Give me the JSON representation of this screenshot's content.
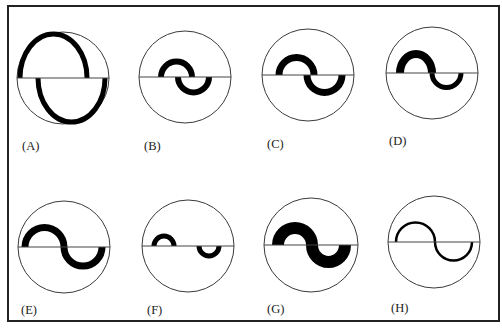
{
  "figure": {
    "background": "#ffffff",
    "frame_color": "#222222",
    "ink_color": "#000000",
    "panels": [
      {
        "id": "A",
        "label": "(A)",
        "cx": 63,
        "cy": 78,
        "r": 46,
        "label_x": 22,
        "label_y": 150,
        "upper": {
          "x1": 20,
          "x2": 87,
          "ry": 44,
          "w": 5
        },
        "lower": {
          "x1": 38,
          "x2": 105,
          "ry": 44,
          "w": 5
        },
        "description": "large S-shaped curve hugging the circle, medium stroke"
      },
      {
        "id": "B",
        "label": "(B)",
        "cx": 185,
        "cy": 77,
        "r": 46,
        "label_x": 144,
        "label_y": 150,
        "upper": {
          "x1": 161,
          "x2": 192,
          "ry": 15.5,
          "w": 6
        },
        "lower": {
          "x1": 178,
          "x2": 209,
          "ry": 15.5,
          "w": 6
        },
        "description": "small S-curve centered, medium-thick stroke"
      },
      {
        "id": "C",
        "label": "(C)",
        "cx": 308,
        "cy": 75,
        "r": 46,
        "label_x": 267,
        "label_y": 148,
        "upper": {
          "x1": 279,
          "x2": 314,
          "ry": 17.5,
          "w": 7
        },
        "lower": {
          "x1": 307,
          "x2": 342,
          "ry": 17.5,
          "w": 7
        },
        "description": "medium S-curve, thick stroke"
      },
      {
        "id": "D",
        "label": "(D)",
        "cx": 432,
        "cy": 73,
        "r": 46,
        "label_x": 389,
        "label_y": 145,
        "upper": {
          "x1": 400,
          "x2": 432,
          "ry": 19,
          "w": 8
        },
        "lower": {
          "x1": 432,
          "x2": 461,
          "ry": 14.5,
          "w": 5
        },
        "description": "S-curve with taller thicker upper arc and thinner lower arc"
      },
      {
        "id": "E",
        "label": "(E)",
        "cx": 64,
        "cy": 247,
        "r": 46,
        "label_x": 21,
        "label_y": 314,
        "upper": {
          "x1": 25,
          "x2": 64,
          "ry": 19.5,
          "w": 7
        },
        "lower": {
          "x1": 64,
          "x2": 102,
          "ry": 19,
          "w": 7
        },
        "description": "wide S-curve spanning most of diameter, thick stroke"
      },
      {
        "id": "F",
        "label": "(F)",
        "cx": 188,
        "cy": 246,
        "r": 46,
        "label_x": 147,
        "label_y": 314,
        "upper": {
          "x1": 154,
          "x2": 174,
          "ry": 10,
          "w": 5
        },
        "lower": {
          "x1": 199,
          "x2": 219,
          "ry": 10,
          "w": 5
        },
        "description": "two small separated half-rings, upper left and lower right"
      },
      {
        "id": "G",
        "label": "(G)",
        "cx": 311,
        "cy": 245,
        "r": 47,
        "label_x": 267,
        "label_y": 313,
        "upper": {
          "x1": 278,
          "x2": 312,
          "ry": 17,
          "w": 12
        },
        "lower": {
          "x1": 312,
          "x2": 345,
          "ry": 17,
          "w": 12
        },
        "description": "S-curve with very thick stroke"
      },
      {
        "id": "H",
        "label": "(H)",
        "cx": 434,
        "cy": 242,
        "r": 46,
        "label_x": 391,
        "label_y": 312,
        "upper": {
          "x1": 396,
          "x2": 435,
          "ry": 19.5,
          "w": 2.5
        },
        "lower": {
          "x1": 435,
          "x2": 472,
          "ry": 18.5,
          "w": 2.5
        },
        "description": "wide S-curve with thin stroke"
      }
    ]
  }
}
